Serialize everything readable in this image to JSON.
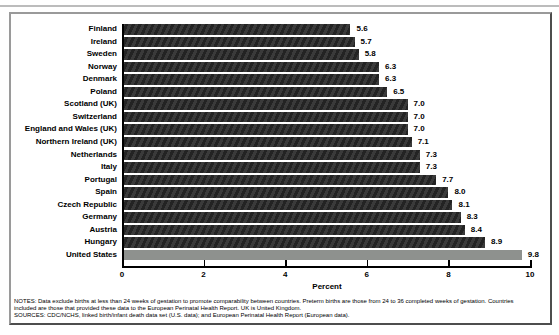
{
  "chart_data": {
    "type": "bar",
    "orientation": "horizontal",
    "categories": [
      "Finland",
      "Ireland",
      "Sweden",
      "Norway",
      "Denmark",
      "Poland",
      "Scotland (UK)",
      "Switzerland",
      "England and Wales (UK)",
      "Northern Ireland (UK)",
      "Netherlands",
      "Italy",
      "Portugal",
      "Spain",
      "Czech Republic",
      "Germany",
      "Austria",
      "Hungary",
      "United States"
    ],
    "values": [
      5.6,
      5.7,
      5.8,
      6.3,
      6.3,
      6.5,
      7.0,
      7.0,
      7.0,
      7.1,
      7.3,
      7.3,
      7.7,
      8.0,
      8.1,
      8.3,
      8.4,
      8.9,
      9.8
    ],
    "value_labels": [
      "5.6",
      "5.7",
      "5.8",
      "6.3",
      "6.3",
      "6.5",
      "7.0",
      "7.0",
      "7.0",
      "7.1",
      "7.3",
      "7.3",
      "7.7",
      "8.0",
      "8.1",
      "8.3",
      "8.4",
      "8.9",
      "9.8"
    ],
    "title": "",
    "xlabel": "Percent",
    "ylabel": "",
    "xlim": [
      0,
      10
    ],
    "xticks": [
      "0",
      "2",
      "4",
      "6",
      "8",
      "10"
    ],
    "grid": false,
    "legend": "none",
    "highlight_category": "United States",
    "bar_color": "#2b2b2b",
    "highlight_bar_color": "#8e918e"
  },
  "notes": {
    "line1": "NOTES: Data exclude births at less than 24 weeks of gestation to promote comparability between countries. Preterm births are those from 24 to 36 completed weeks of gestation. Countries",
    "line2": "included are those that provided these data to the European Perinatal Health Report. UK is United Kingdom.",
    "line3": "SOURCES: CDC/NCHS, linked birth/infant death data set (U.S. data); and European Perinatal Health Report (European data)."
  }
}
